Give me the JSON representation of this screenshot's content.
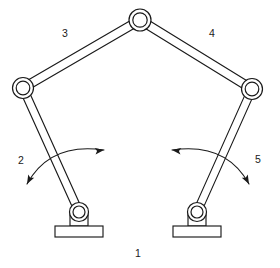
{
  "diagram": {
    "type": "kinematic-linkage-schematic",
    "width": 280,
    "height": 268,
    "background_color": "#ffffff",
    "line_color": "#1a1a1a",
    "labels": {
      "ground": "1",
      "left_crank": "2",
      "left_coupler": "3",
      "right_coupler": "4",
      "right_crank": "5"
    },
    "label_positions": {
      "ground": {
        "x": 138,
        "y": 254
      },
      "left_crank": {
        "x": 21,
        "y": 161
      },
      "left_coupler": {
        "x": 65,
        "y": 34
      },
      "right_coupler": {
        "x": 212,
        "y": 34
      },
      "right_crank": {
        "x": 258,
        "y": 160
      }
    },
    "joints": [
      {
        "name": "left-ground-pivot",
        "x": 79,
        "y": 212,
        "outer_r": 9.5,
        "inner_r": 6.0
      },
      {
        "name": "left-elbow-joint",
        "x": 23,
        "y": 88,
        "outer_r": 10.5,
        "inner_r": 6.8
      },
      {
        "name": "top-apex-joint",
        "x": 140,
        "y": 20,
        "outer_r": 11.0,
        "inner_r": 7.2
      },
      {
        "name": "right-elbow-joint",
        "x": 252,
        "y": 89,
        "outer_r": 10.5,
        "inner_r": 6.8
      },
      {
        "name": "right-ground-pivot",
        "x": 197,
        "y": 212,
        "outer_r": 9.5,
        "inner_r": 6.0
      }
    ],
    "links": [
      {
        "name": "left-crank-link-2",
        "from": "left-ground-pivot",
        "to": "left-elbow-joint",
        "half_width": 4.0
      },
      {
        "name": "left-coupler-link-3",
        "from": "left-elbow-joint",
        "to": "top-apex-joint",
        "half_width": 4.3
      },
      {
        "name": "right-coupler-link-4",
        "from": "top-apex-joint",
        "to": "right-elbow-joint",
        "half_width": 4.3
      },
      {
        "name": "right-crank-link-5",
        "from": "right-elbow-joint",
        "to": "right-ground-pivot",
        "half_width": 4.0
      }
    ],
    "ground_supports": [
      {
        "name": "left-ground-support",
        "post": {
          "x": 70,
          "y": 212,
          "width": 18,
          "height": 14
        },
        "base": {
          "x": 55,
          "y": 226,
          "width": 48,
          "height": 11
        },
        "hatch_count": 7
      },
      {
        "name": "right-ground-support",
        "post": {
          "x": 188,
          "y": 212,
          "width": 18,
          "height": 14
        },
        "base": {
          "x": 173,
          "y": 226,
          "width": 48,
          "height": 11
        },
        "hatch_count": 7
      }
    ],
    "motion_arrows": [
      {
        "name": "left-crank-motion-arc",
        "path": "M 27 184 Q 50 142 104 150",
        "head_start": {
          "x": 27,
          "y": 184,
          "angle": 118
        },
        "head_end": {
          "x": 104,
          "y": 150,
          "angle": -8
        }
      },
      {
        "name": "right-crank-motion-arc",
        "path": "M 249 184 Q 226 142 172 150",
        "head_start": {
          "x": 249,
          "y": 184,
          "angle": 62
        },
        "head_end": {
          "x": 172,
          "y": 150,
          "angle": 188
        }
      }
    ]
  }
}
